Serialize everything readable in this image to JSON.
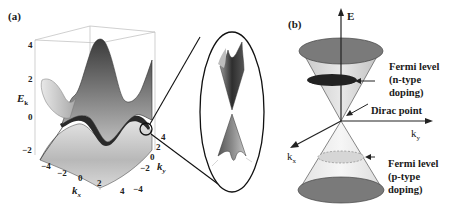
{
  "panel_a": {
    "label": "(a)",
    "y_axis_title": "E",
    "y_axis_subscript": "k",
    "y_ticks": [
      "4",
      "2",
      "0",
      "−2"
    ],
    "kx_axis_title": "k",
    "kx_axis_subscript": "x",
    "kx_ticks": [
      "−4",
      "−2",
      "0",
      "2",
      "4"
    ],
    "ky_axis_title": "k",
    "ky_axis_subscript": "y",
    "ky_ticks": [
      "4",
      "2",
      "0",
      "−2",
      "−4"
    ],
    "inset_description": "Magnified view of Dirac cone at band touching point"
  },
  "panel_b": {
    "label": "(b)",
    "e_axis_label": "E",
    "ky_axis_label": "k",
    "ky_axis_subscript": "y",
    "kx_axis_label": "k",
    "kx_axis_subscript": "x",
    "annotations": {
      "fermi_n": [
        "Fermi level",
        "(n-type",
        "doping)"
      ],
      "dirac_point": "Dirac point",
      "fermi_p": [
        "Fermi level",
        "(p-type",
        "doping)"
      ]
    }
  },
  "colors": {
    "cone_cap": "#777777",
    "cone_body": "#dddddd",
    "fermi_n_disc": "#222222",
    "fermi_p_disc": "#d4d4d4",
    "lines": "#1a1a1a"
  }
}
